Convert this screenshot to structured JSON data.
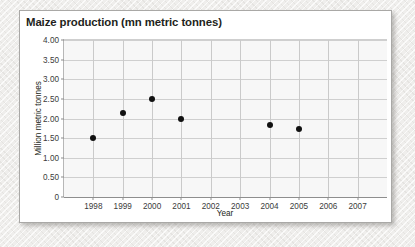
{
  "card": {
    "title": "Maize production (mn metric tonnes)"
  },
  "chart_data": {
    "type": "scatter",
    "title": "Maize production (mn metric tonnes)",
    "xlabel": "Year",
    "ylabel": "Million metric tonnes",
    "categories": [
      "1998",
      "1999",
      "2000",
      "2001",
      "2002",
      "2003",
      "2004",
      "2005",
      "2006",
      "2007"
    ],
    "x_tick_labels": [
      "1998",
      "1999",
      "2000",
      "2001",
      "2002",
      "2003",
      "2004",
      "2005",
      "2006",
      "2007"
    ],
    "y_tick_labels": [
      "0",
      "0.50",
      "1.00",
      "1.50",
      "2.00",
      "2.50",
      "3.00",
      "3.50",
      "4.00"
    ],
    "y_tick_values": [
      0,
      0.5,
      1.0,
      1.5,
      2.0,
      2.5,
      3.0,
      3.5,
      4.0
    ],
    "ylim": [
      0,
      4.0
    ],
    "grid": true,
    "legend": "none",
    "marker_color": "#111111",
    "plot_background": "#f7f7f7",
    "points": [
      {
        "x": "1998",
        "y": 1.51
      },
      {
        "x": "1999",
        "y": 2.14
      },
      {
        "x": "2000",
        "y": 2.5
      },
      {
        "x": "2001",
        "y": 2.0
      },
      {
        "x": "2004",
        "y": 1.83
      },
      {
        "x": "2005",
        "y": 1.73
      }
    ],
    "series": [
      {
        "name": "Maize production",
        "x": [
          "1998",
          "1999",
          "2000",
          "2001",
          "2002",
          "2003",
          "2004",
          "2005",
          "2006",
          "2007"
        ],
        "values": [
          1.51,
          2.14,
          2.5,
          2.0,
          null,
          null,
          1.83,
          1.73,
          null,
          null
        ]
      }
    ]
  }
}
